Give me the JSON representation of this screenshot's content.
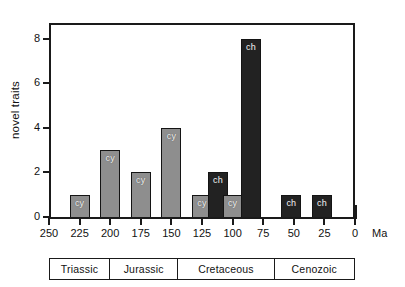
{
  "chart_data": {
    "type": "bar",
    "title": "",
    "xlabel": "Ma",
    "ylabel": "novel traits",
    "xlim": [
      250,
      0
    ],
    "ylim": [
      0,
      8.7
    ],
    "x_reversed": true,
    "grid": false,
    "legend": null,
    "x_ticks": [
      250,
      225,
      200,
      175,
      150,
      125,
      100,
      75,
      50,
      25,
      0
    ],
    "x_tick_labels": [
      "250",
      "225",
      "200",
      "175",
      "150",
      "125",
      "100",
      "75",
      "50",
      "25",
      "0"
    ],
    "y_ticks": [
      0,
      2,
      4,
      6,
      8
    ],
    "y_tick_labels": [
      "0",
      "2",
      "4",
      "6",
      "8"
    ],
    "bars": [
      {
        "x": 225,
        "value": 1,
        "label": "cy",
        "group": "cy",
        "color": "#8e8e8e"
      },
      {
        "x": 200,
        "value": 3,
        "label": "cy",
        "group": "cy",
        "color": "#8e8e8e"
      },
      {
        "x": 175,
        "value": 2,
        "label": "cy",
        "group": "cy",
        "color": "#8e8e8e"
      },
      {
        "x": 150,
        "value": 4,
        "label": "cy",
        "group": "cy",
        "color": "#8e8e8e"
      },
      {
        "x": 125,
        "value": 1,
        "label": "cy",
        "group": "cy",
        "color": "#8e8e8e"
      },
      {
        "x": 112,
        "value": 2,
        "label": "ch",
        "group": "ch",
        "color": "#222222"
      },
      {
        "x": 100,
        "value": 1,
        "label": "cy",
        "group": "cy",
        "color": "#8e8e8e"
      },
      {
        "x": 85,
        "value": 8,
        "label": "ch",
        "group": "ch",
        "color": "#222222"
      },
      {
        "x": 52,
        "value": 1,
        "label": "ch",
        "group": "ch",
        "color": "#222222"
      },
      {
        "x": 27,
        "value": 1,
        "label": "ch",
        "group": "ch",
        "color": "#222222"
      }
    ],
    "periods": [
      {
        "name": "Triassic",
        "start": 250,
        "end": 201
      },
      {
        "name": "Jurassic",
        "start": 201,
        "end": 145
      },
      {
        "name": "Cretaceous",
        "start": 145,
        "end": 66
      },
      {
        "name": "Cenozoic",
        "start": 66,
        "end": 0
      }
    ]
  }
}
